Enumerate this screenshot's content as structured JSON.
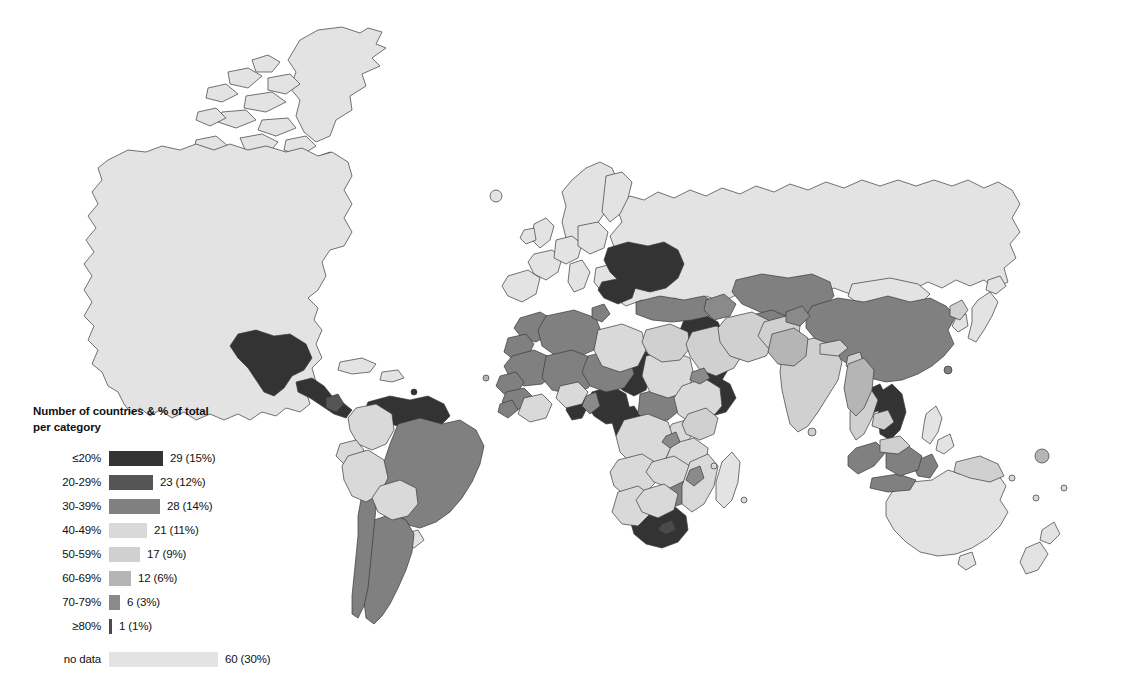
{
  "figure": {
    "type": "choropleth-world-map",
    "background_color": "#ffffff",
    "border_color": "#3a3a3a"
  },
  "legend": {
    "title": "Number of countries & % of total per category",
    "title_line_1": "Number of countries & % of total",
    "title_line_2": "per category",
    "rows": [
      {
        "label": "≤20%",
        "count_label": "29 (15%)",
        "count": 29,
        "percent": 15,
        "color": "#333333",
        "bar_width": 54
      },
      {
        "label": "20-29%",
        "count_label": "23 (12%)",
        "count": 23,
        "percent": 12,
        "color": "#555555",
        "bar_width": 44
      },
      {
        "label": "30-39%",
        "count_label": "28 (14%)",
        "count": 28,
        "percent": 14,
        "color": "#808080",
        "bar_width": 51
      },
      {
        "label": "40-49%",
        "count_label": "21 (11%)",
        "count": 21,
        "percent": 11,
        "color": "#d9d9d9",
        "bar_width": 38
      },
      {
        "label": "50-59%",
        "count_label": "17 (9%)",
        "count": 17,
        "percent": 9,
        "color": "#d0d0d0",
        "bar_width": 31
      },
      {
        "label": "60-69%",
        "count_label": "12 (6%)",
        "count": 12,
        "percent": 6,
        "color": "#b5b5b5",
        "bar_width": 22
      },
      {
        "label": "70-79%",
        "count_label": "6 (3%)",
        "count": 6,
        "percent": 3,
        "color": "#8a8a8a",
        "bar_width": 11
      },
      {
        "label": "≥80%",
        "count_label": "1 (1%)",
        "count": 1,
        "percent": 1,
        "color": "#4a4a4a",
        "bar_width": 3
      }
    ],
    "no_data": {
      "label": "no data",
      "count_label": "60 (30%)",
      "count": 60,
      "percent": 30,
      "color": "#e3e3e3",
      "bar_width": 109
    }
  },
  "chart_data": {
    "type": "map",
    "title": "",
    "subtitle": "",
    "xlabel": "",
    "ylabel": "",
    "legend_position": "bottom-left",
    "grid": false,
    "categories": [
      "≤20%",
      "20-29%",
      "30-39%",
      "40-49%",
      "50-59%",
      "60-69%",
      "70-79%",
      "≥80%",
      "no data"
    ],
    "values": [
      29,
      23,
      28,
      21,
      17,
      12,
      6,
      1,
      60
    ],
    "percents": [
      15,
      12,
      14,
      11,
      9,
      6,
      3,
      1,
      30
    ],
    "colors": [
      "#333333",
      "#555555",
      "#808080",
      "#d9d9d9",
      "#d0d0d0",
      "#b5b5b5",
      "#8a8a8a",
      "#4a4a4a",
      "#e3e3e3"
    ],
    "total_countries": 197,
    "regions": [
      {
        "name": "Canada",
        "category": "no data"
      },
      {
        "name": "United States",
        "category": "no data"
      },
      {
        "name": "Greenland",
        "category": "no data"
      },
      {
        "name": "Mexico",
        "category": "≤20%"
      },
      {
        "name": "Guatemala",
        "category": "≤20%"
      },
      {
        "name": "Honduras",
        "category": "≤20%"
      },
      {
        "name": "Nicaragua",
        "category": "≤20%"
      },
      {
        "name": "Costa Rica",
        "category": "20-29%"
      },
      {
        "name": "Panama",
        "category": "≤20%"
      },
      {
        "name": "Cuba",
        "category": "no data"
      },
      {
        "name": "Colombia",
        "category": "40-49%"
      },
      {
        "name": "Venezuela",
        "category": "≤20%"
      },
      {
        "name": "Guyana",
        "category": "≤20%"
      },
      {
        "name": "Suriname",
        "category": "≤20%"
      },
      {
        "name": "Ecuador",
        "category": "40-49%"
      },
      {
        "name": "Peru",
        "category": "40-49%"
      },
      {
        "name": "Brazil",
        "category": "30-39%"
      },
      {
        "name": "Bolivia",
        "category": "40-49%"
      },
      {
        "name": "Paraguay",
        "category": "20-29%"
      },
      {
        "name": "Chile",
        "category": "30-39%"
      },
      {
        "name": "Argentina",
        "category": "30-39%"
      },
      {
        "name": "Uruguay",
        "category": "no data"
      },
      {
        "name": "Morocco",
        "category": "30-39%"
      },
      {
        "name": "Algeria",
        "category": "30-39%"
      },
      {
        "name": "Tunisia",
        "category": "30-39%"
      },
      {
        "name": "Libya",
        "category": "40-49%"
      },
      {
        "name": "Egypt",
        "category": "50-59%"
      },
      {
        "name": "Western Sahara",
        "category": "30-39%"
      },
      {
        "name": "Mauritania",
        "category": "30-39%"
      },
      {
        "name": "Mali",
        "category": "30-39%"
      },
      {
        "name": "Niger",
        "category": "30-39%"
      },
      {
        "name": "Chad",
        "category": "≤20%"
      },
      {
        "name": "Sudan",
        "category": "40-49%"
      },
      {
        "name": "Senegal",
        "category": "30-39%"
      },
      {
        "name": "Guinea",
        "category": "30-39%"
      },
      {
        "name": "Sierra Leone",
        "category": "30-39%"
      },
      {
        "name": "Liberia",
        "category": "30-39%"
      },
      {
        "name": "Ivory Coast",
        "category": "40-49%"
      },
      {
        "name": "Ghana",
        "category": "≤20%"
      },
      {
        "name": "Burkina Faso",
        "category": "40-49%"
      },
      {
        "name": "Nigeria",
        "category": "≤20%"
      },
      {
        "name": "Cameroon",
        "category": "≤20%"
      },
      {
        "name": "Central African Republic",
        "category": "30-39%"
      },
      {
        "name": "Ethiopia",
        "category": "40-49%"
      },
      {
        "name": "Somalia",
        "category": "≤20%"
      },
      {
        "name": "Kenya",
        "category": "50-59%"
      },
      {
        "name": "Uganda",
        "category": "40-49%"
      },
      {
        "name": "Tanzania",
        "category": "40-49%"
      },
      {
        "name": "DR Congo",
        "category": "40-49%"
      },
      {
        "name": "Angola",
        "category": "40-49%"
      },
      {
        "name": "Zambia",
        "category": "40-49%"
      },
      {
        "name": "Zimbabwe",
        "category": "30-39%"
      },
      {
        "name": "Mozambique",
        "category": "40-49%"
      },
      {
        "name": "Madagascar",
        "category": "no data"
      },
      {
        "name": "Namibia",
        "category": "40-49%"
      },
      {
        "name": "Botswana",
        "category": "40-49%"
      },
      {
        "name": "South Africa",
        "category": "≤20%"
      },
      {
        "name": "United Kingdom",
        "category": "no data"
      },
      {
        "name": "Ireland",
        "category": "no data"
      },
      {
        "name": "France",
        "category": "no data"
      },
      {
        "name": "Spain",
        "category": "no data"
      },
      {
        "name": "Portugal",
        "category": "no data"
      },
      {
        "name": "Germany",
        "category": "no data"
      },
      {
        "name": "Poland",
        "category": "no data"
      },
      {
        "name": "Italy",
        "category": "no data"
      },
      {
        "name": "Norway",
        "category": "no data"
      },
      {
        "name": "Sweden",
        "category": "no data"
      },
      {
        "name": "Finland",
        "category": "no data"
      },
      {
        "name": "Ukraine",
        "category": "≤20%"
      },
      {
        "name": "Belarus",
        "category": "≤20%"
      },
      {
        "name": "Romania",
        "category": "≤20%"
      },
      {
        "name": "Bulgaria",
        "category": "≤20%"
      },
      {
        "name": "Serbia",
        "category": "≤20%"
      },
      {
        "name": "Greece",
        "category": "no data"
      },
      {
        "name": "Turkey",
        "category": "30-39%"
      },
      {
        "name": "Syria",
        "category": "≤20%"
      },
      {
        "name": "Iraq",
        "category": "≤20%"
      },
      {
        "name": "Iran",
        "category": "50-59%"
      },
      {
        "name": "Saudi Arabia",
        "category": "50-59%"
      },
      {
        "name": "Yemen",
        "category": "≤20%"
      },
      {
        "name": "Russia",
        "category": "no data"
      },
      {
        "name": "Kazakhstan",
        "category": "30-39%"
      },
      {
        "name": "Uzbekistan",
        "category": "30-39%"
      },
      {
        "name": "Turkmenistan",
        "category": "30-39%"
      },
      {
        "name": "Afghanistan",
        "category": "50-59%"
      },
      {
        "name": "Pakistan",
        "category": "60-69%"
      },
      {
        "name": "India",
        "category": "50-59%"
      },
      {
        "name": "Nepal",
        "category": "50-59%"
      },
      {
        "name": "Bangladesh",
        "category": "50-59%"
      },
      {
        "name": "Myanmar",
        "category": "60-69%"
      },
      {
        "name": "Thailand",
        "category": "50-59%"
      },
      {
        "name": "Laos",
        "category": "≤20%"
      },
      {
        "name": "Vietnam",
        "category": "≤20%"
      },
      {
        "name": "Cambodia",
        "category": "50-59%"
      },
      {
        "name": "Malaysia",
        "category": "50-59%"
      },
      {
        "name": "Indonesia",
        "category": "30-39%"
      },
      {
        "name": "Philippines",
        "category": "no data"
      },
      {
        "name": "China",
        "category": "30-39%"
      },
      {
        "name": "Mongolia",
        "category": "no data"
      },
      {
        "name": "Japan",
        "category": "no data"
      },
      {
        "name": "South Korea",
        "category": "no data"
      },
      {
        "name": "North Korea",
        "category": "50-59%"
      },
      {
        "name": "Papua New Guinea",
        "category": "50-59%"
      },
      {
        "name": "Australia",
        "category": "no data"
      },
      {
        "name": "New Zealand",
        "category": "no data"
      }
    ]
  }
}
